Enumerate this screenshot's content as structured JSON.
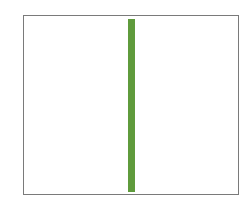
{
  "figure": {
    "frame": {
      "border_color": "#7a7a7a",
      "background": "#ffffff"
    },
    "bar": {
      "color": "#5f9b3c",
      "orientation": "vertical"
    }
  }
}
